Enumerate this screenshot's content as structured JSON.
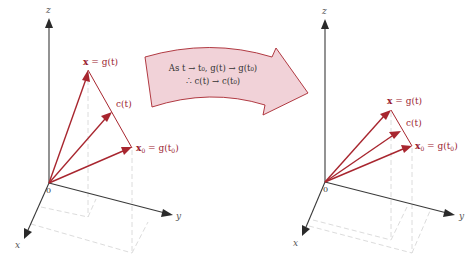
{
  "figure": {
    "left_panel": {
      "axes": {
        "z": "z",
        "y": "y",
        "x": "x",
        "origin": "0"
      },
      "labels": {
        "x_eq_g": {
          "lhs": "x",
          "rhs": " = g(t)"
        },
        "c_t": "c(t)",
        "x0_eq_g0": {
          "lhs": "x",
          "sub": "0",
          "rhs": " = g(t",
          "rhs_sub": "0",
          "rhs_end": ")"
        }
      }
    },
    "right_panel": {
      "axes": {
        "z": "z",
        "y": "y",
        "x": "x",
        "origin": "0"
      },
      "labels": {
        "x_eq_g": {
          "lhs": "x",
          "rhs": " = g(t)"
        },
        "c_t": "c(t)",
        "x0_eq_g0": {
          "lhs": "x",
          "sub": "0",
          "rhs": " = g(t",
          "rhs_sub": "0",
          "rhs_end": ")"
        }
      }
    },
    "banner": {
      "line1": "As t → t₀, g(t) → g(t₀)",
      "line2": "∴ c(t) → c(t₀)"
    },
    "colors": {
      "vector": "#a8262f",
      "banner_fill": "#f1d2d8",
      "axis": "#3a3a3a",
      "dashed": "#dcdcdc"
    }
  }
}
